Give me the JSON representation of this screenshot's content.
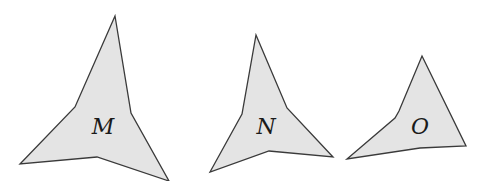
{
  "figure": {
    "colors": {
      "fill": "#e4e4e4",
      "stroke": "#3a3a3a",
      "label": "#1a1a1a",
      "background": "#ffffff"
    },
    "shapes": [
      {
        "id": "M",
        "label": "M",
        "points": "115,16 131,113 169,181 97,157 20,164 75,107",
        "label_pos": {
          "x": 103,
          "y": 128
        }
      },
      {
        "id": "N",
        "label": "N",
        "points": "256,35 287,108 333,157 269,151 210,172 242,114",
        "label_pos": {
          "x": 266,
          "y": 128
        }
      },
      {
        "id": "O",
        "label": "O",
        "points": "422,56 466,146 420,148 347,159 395,118 399,111",
        "label_pos": {
          "x": 420,
          "y": 128
        }
      }
    ]
  }
}
